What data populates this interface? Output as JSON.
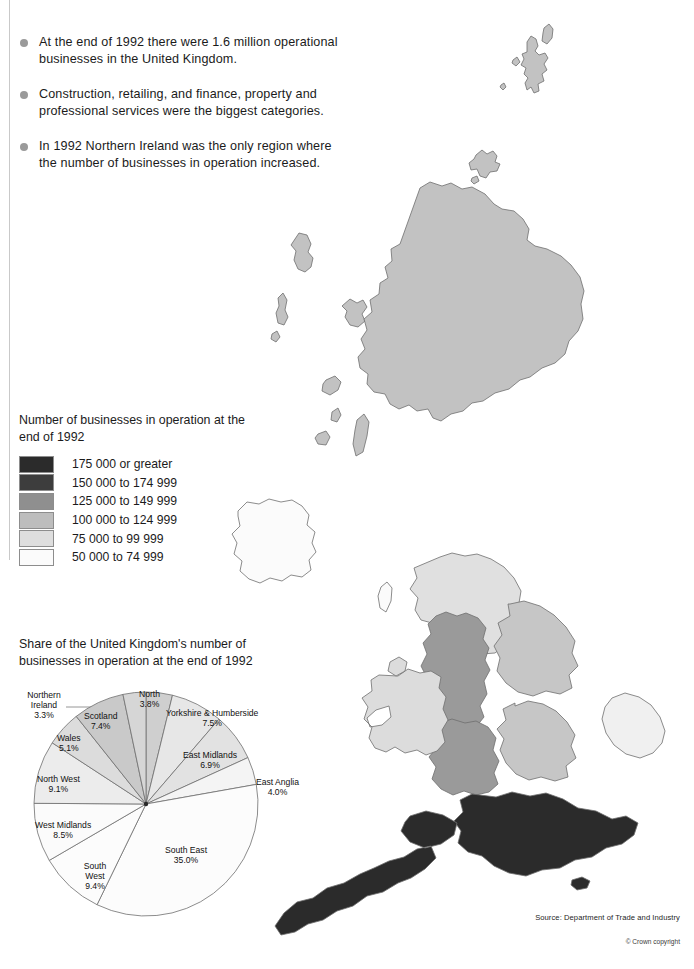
{
  "bullets": [
    "At the end of 1992 there were 1.6 million operational businesses in the United Kingdom.",
    "Construction, retailing, and finance, property and professional services were the biggest categories.",
    "In 1992 Northern Ireland was the only region where the number of businesses in operation increased."
  ],
  "legend": {
    "title": "Number of businesses in operation at the end of 1992",
    "items": [
      {
        "label": "175 000 or greater",
        "color": "#2b2b2b"
      },
      {
        "label": "150 000 to 174 999",
        "color": "#3d3d3d"
      },
      {
        "label": "125 000 to 149 999",
        "color": "#8f8f8f"
      },
      {
        "label": "100 000 to 124 999",
        "color": "#bdbdbd"
      },
      {
        "label": "75 000 to 99 999",
        "color": "#dedede"
      },
      {
        "label": "50 000 to 74 999",
        "color": "#fbfbfb"
      }
    ]
  },
  "pie": {
    "title": "Share of the United Kingdom's number of businesses in operation at the end of 1992"
  },
  "chart_data": {
    "type": "pie",
    "title": "Share of the United Kingdom's number of businesses in operation at the end of 1992",
    "unit": "percent",
    "start_angle_deg": 0,
    "direction": "clockwise",
    "categories": [
      "North",
      "Yorkshire & Humberside",
      "East Midlands",
      "East Anglia",
      "South East",
      "South West",
      "West Midlands",
      "North West",
      "Wales",
      "Scotland",
      "Northern Ireland"
    ],
    "values": [
      3.8,
      7.5,
      6.9,
      4.0,
      35.0,
      9.4,
      8.5,
      9.1,
      5.1,
      7.4,
      3.3
    ],
    "labels": [
      "3.8%",
      "7.5%",
      "6.9%",
      "4.0%",
      "35.0%",
      "9.4%",
      "8.5%",
      "9.1%",
      "5.1%",
      "7.4%",
      "3.3%"
    ],
    "slice_colors": [
      "#cfcfcf",
      "#e7e7e7",
      "#e2e2e2",
      "#f4f4f4",
      "#fcfcfc",
      "#fcfcfc",
      "#fbfbfb",
      "#ececec",
      "#dcdcdc",
      "#c9c9c9",
      "#d6d6d6"
    ],
    "leader_labels": [
      "Northern Ireland",
      "East Anglia"
    ],
    "legend": "none",
    "grid": false
  },
  "map": {
    "regions": [
      {
        "name": "Scotland",
        "band": "125 000 to 149 999",
        "color": "#c2c2c2"
      },
      {
        "name": "Northern Ireland",
        "band": "50 000 to 74 999",
        "color": "#fbfbfb"
      },
      {
        "name": "North",
        "band": "75 000 to 99 999",
        "color": "#e0e0e0"
      },
      {
        "name": "North West",
        "band": "125 000 to 149 999",
        "color": "#9a9a9a"
      },
      {
        "name": "Yorkshire & Humberside",
        "band": "100 000 to 124 999",
        "color": "#c6c6c6"
      },
      {
        "name": "East Midlands",
        "band": "100 000 to 124 999",
        "color": "#c6c6c6"
      },
      {
        "name": "West Midlands",
        "band": "125 000 to 149 999",
        "color": "#9a9a9a"
      },
      {
        "name": "Wales",
        "band": "75 000 to 99 999",
        "color": "#dcdcdc"
      },
      {
        "name": "East Anglia",
        "band": "50 000 to 74 999",
        "color": "#f0f0f0"
      },
      {
        "name": "South East",
        "band": "175 000 or greater",
        "color": "#2b2b2b"
      },
      {
        "name": "South West",
        "band": "175 000 or greater",
        "color": "#2b2b2b"
      }
    ]
  },
  "footer": {
    "source": "Source: Department of Trade and Industry",
    "copyright": "© Crown copyright"
  }
}
